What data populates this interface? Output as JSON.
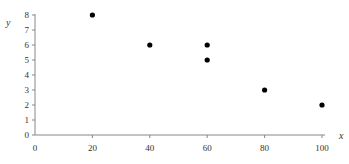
{
  "chart_data": {
    "type": "scatter",
    "title": "",
    "xlabel": "x",
    "ylabel": "y",
    "xlim": [
      0,
      100
    ],
    "ylim": [
      0,
      8
    ],
    "xticks": [
      0,
      20,
      40,
      60,
      80,
      100
    ],
    "yticks": [
      0,
      1,
      2,
      3,
      4,
      5,
      6,
      7,
      8
    ],
    "grid": false,
    "legend": null,
    "points": [
      {
        "x": 20,
        "y": 8
      },
      {
        "x": 40,
        "y": 6
      },
      {
        "x": 60,
        "y": 6
      },
      {
        "x": 60,
        "y": 5
      },
      {
        "x": 80,
        "y": 3
      },
      {
        "x": 100,
        "y": 2
      }
    ],
    "marker_color": "#000000",
    "axis_color": "#888888"
  }
}
